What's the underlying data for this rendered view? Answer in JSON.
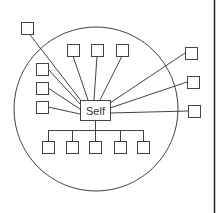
{
  "diagram": {
    "center_label": "Self",
    "colors": {
      "stroke": "#444444",
      "background": "#ffffff",
      "border_line": "#222222"
    },
    "circle": {
      "cx": 96,
      "cy": 109,
      "r": 82
    },
    "self_box": {
      "x": 80,
      "y": 100,
      "w": 30,
      "h": 20
    },
    "outside_nodes": [
      {
        "id": "out-top-left",
        "x": 21,
        "y": 22
      },
      {
        "id": "out-right-1",
        "x": 185,
        "y": 47
      },
      {
        "id": "out-right-2",
        "x": 187,
        "y": 76
      },
      {
        "id": "out-right-3",
        "x": 188,
        "y": 105
      }
    ],
    "inside_nodes": [
      {
        "id": "in-top-1",
        "x": 67,
        "y": 44
      },
      {
        "id": "in-top-2",
        "x": 91,
        "y": 44
      },
      {
        "id": "in-top-3",
        "x": 116,
        "y": 44
      },
      {
        "id": "in-left-1",
        "x": 36,
        "y": 63
      },
      {
        "id": "in-left-2",
        "x": 36,
        "y": 82
      },
      {
        "id": "in-left-3",
        "x": 36,
        "y": 101
      }
    ],
    "bottom_nodes": [
      {
        "id": "in-bottom-1",
        "x": 42,
        "y": 141
      },
      {
        "id": "in-bottom-2",
        "x": 66,
        "y": 141
      },
      {
        "id": "in-bottom-3",
        "x": 89,
        "y": 141
      },
      {
        "id": "in-bottom-4",
        "x": 114,
        "y": 141
      },
      {
        "id": "in-bottom-5",
        "x": 137,
        "y": 141
      }
    ],
    "node_size": 12,
    "bus_y": 130
  }
}
